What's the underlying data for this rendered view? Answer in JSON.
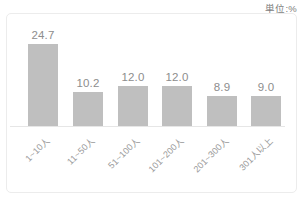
{
  "unit_label": "単位:%",
  "colors": {
    "bar": "#bfbfbf",
    "value_text": "#8d8d8d",
    "category_text": "#9a9a9a",
    "axis": "#e6e6e6",
    "panel_border": "#ececec",
    "background": "#ffffff"
  },
  "chart_data": {
    "type": "bar",
    "title": "",
    "subtitle": "",
    "xlabel": "",
    "ylabel": "",
    "unit": "%",
    "unit_annotation": "単位:%",
    "grid": false,
    "legend": false,
    "legend_position": "none",
    "ylim": [
      0,
      26
    ],
    "categories": [
      "1~10人",
      "11~50人",
      "51~100人",
      "101~200人",
      "201~300人",
      "301人以上"
    ],
    "values": [
      24.7,
      10.2,
      12.0,
      12.0,
      8.9,
      9.0
    ],
    "value_labels": [
      "24.7",
      "10.2",
      "12.0",
      "12.0",
      "8.9",
      "9.0"
    ]
  }
}
